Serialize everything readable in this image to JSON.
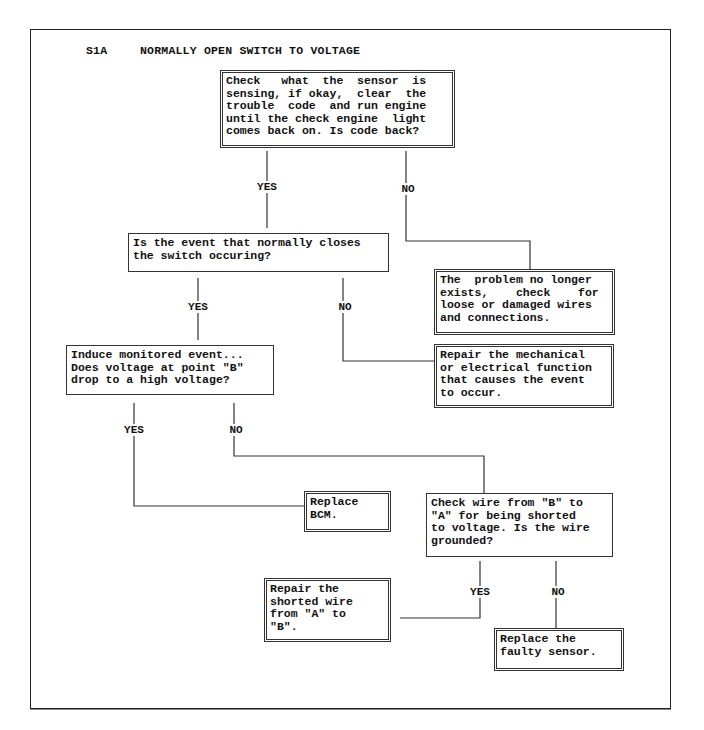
{
  "title": {
    "code": "S1A",
    "text": "NORMALLY OPEN SWITCH TO VOLTAGE"
  },
  "nodes": [
    {
      "id": "check-sensor",
      "type": "action",
      "border": "double",
      "text": "Check   what  the  sensor  is\nsensing, if okay,  clear  the\ntrouble  code  and run engine\nuntil the check engine  light\ncomes back on. Is code back?",
      "box": {
        "left": 220,
        "top": 70,
        "width": 235,
        "height": 78
      }
    },
    {
      "id": "event-occurring",
      "type": "decision",
      "border": "single",
      "text": "Is the event that normally closes\nthe switch occuring?",
      "box": {
        "left": 128,
        "top": 233,
        "width": 261,
        "height": 39
      }
    },
    {
      "id": "problem-no-longer-exists",
      "type": "result",
      "border": "double",
      "text": "The  problem no longer\nexists,    check    for\nloose or damaged wires\nand connections.",
      "box": {
        "left": 434,
        "top": 269,
        "width": 181,
        "height": 66
      }
    },
    {
      "id": "induce-event",
      "type": "decision",
      "border": "single",
      "text": "Induce monitored event...\nDoes voltage at point \"B\"\ndrop to a high voltage?",
      "box": {
        "left": 66,
        "top": 345,
        "width": 208,
        "height": 50
      }
    },
    {
      "id": "repair-mechanical",
      "type": "result",
      "border": "double",
      "text": "Repair the mechanical\nor electrical function\nthat causes the event\nto occur.",
      "box": {
        "left": 434,
        "top": 344,
        "width": 180,
        "height": 64
      }
    },
    {
      "id": "replace-bcm",
      "type": "result",
      "border": "double",
      "text": "Replace\nBCM.",
      "box": {
        "left": 304,
        "top": 491,
        "width": 87,
        "height": 41
      }
    },
    {
      "id": "check-wire",
      "type": "decision",
      "border": "single",
      "text": "Check wire from \"B\" to\n\"A\" for being shorted\nto voltage. Is the wire\ngrounded?",
      "box": {
        "left": 426,
        "top": 493,
        "width": 187,
        "height": 64
      }
    },
    {
      "id": "repair-shorted-wire",
      "type": "result",
      "border": "double",
      "text": "Repair the\nshorted wire\nfrom \"A\" to\n\"B\".",
      "box": {
        "left": 264,
        "top": 578,
        "width": 127,
        "height": 64
      }
    },
    {
      "id": "replace-faulty-sensor",
      "type": "result",
      "border": "double",
      "text": "Replace the\nfaulty sensor.",
      "box": {
        "left": 494,
        "top": 628,
        "width": 130,
        "height": 43
      }
    }
  ],
  "edges": [
    {
      "from": "check-sensor",
      "to": "event-occurring",
      "label": "YES",
      "label_pos": [
        267,
        187
      ],
      "points": [
        [
          267,
          151
        ],
        [
          267,
          228
        ]
      ]
    },
    {
      "from": "check-sensor",
      "to": "problem-no-longer-exists",
      "label": "NO",
      "label_pos": [
        408,
        189
      ],
      "points": [
        [
          406,
          151
        ],
        [
          406,
          241
        ],
        [
          530,
          241
        ],
        [
          530,
          269
        ]
      ]
    },
    {
      "from": "event-occurring",
      "to": "induce-event",
      "label": "YES",
      "label_pos": [
        198,
        307
      ],
      "points": [
        [
          198,
          278
        ],
        [
          198,
          340
        ]
      ]
    },
    {
      "from": "event-occurring",
      "to": "repair-mechanical",
      "label": "NO",
      "label_pos": [
        345,
        307
      ],
      "points": [
        [
          343,
          278
        ],
        [
          343,
          361
        ],
        [
          434,
          361
        ]
      ]
    },
    {
      "from": "induce-event",
      "to": "replace-bcm",
      "label": "YES",
      "label_pos": [
        134,
        430
      ],
      "points": [
        [
          134,
          403
        ],
        [
          134,
          506
        ],
        [
          304,
          506
        ]
      ]
    },
    {
      "from": "induce-event",
      "to": "check-wire",
      "label": "NO",
      "label_pos": [
        236,
        430
      ],
      "points": [
        [
          234,
          403
        ],
        [
          234,
          456
        ],
        [
          484,
          456
        ],
        [
          484,
          493
        ]
      ]
    },
    {
      "from": "check-wire",
      "to": "repair-shorted-wire",
      "label": "YES",
      "label_pos": [
        480,
        592
      ],
      "points": [
        [
          480,
          561
        ],
        [
          480,
          618
        ],
        [
          400,
          618
        ]
      ]
    },
    {
      "from": "check-wire",
      "to": "replace-faulty-sensor",
      "label": "NO",
      "label_pos": [
        558,
        592
      ],
      "points": [
        [
          556,
          561
        ],
        [
          556,
          628
        ]
      ]
    }
  ],
  "colors": {
    "line": "#333333",
    "text": "#111111",
    "background": "#ffffff"
  }
}
